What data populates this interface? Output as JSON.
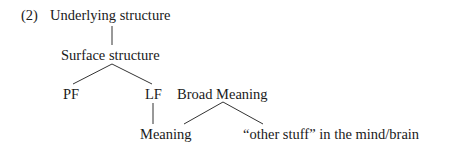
{
  "example_number": "(2)",
  "tree": {
    "root": "Underlying structure",
    "surface": "Surface structure",
    "pf": "PF",
    "lf": "LF",
    "broad_meaning": "Broad Meaning",
    "meaning": "Meaning",
    "other_stuff": "“other stuff” in the mind/brain"
  },
  "edges": [
    {
      "from": "Underlying structure",
      "to": "Surface structure"
    },
    {
      "from": "Surface structure",
      "to": "PF"
    },
    {
      "from": "Surface structure",
      "to": "LF"
    },
    {
      "from": "LF",
      "to": "Meaning"
    },
    {
      "from": "Broad Meaning",
      "to": "Meaning"
    },
    {
      "from": "Broad Meaning",
      "to": "“other stuff” in the mind/brain"
    }
  ]
}
